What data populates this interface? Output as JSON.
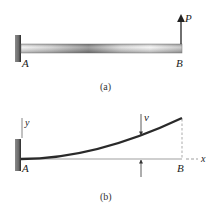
{
  "figure_a": {
    "caption": "(a)",
    "labels": {
      "fixed_end": "A",
      "free_end": "B",
      "load": "P"
    },
    "elements": [
      "fixed-wall-support",
      "cantilever-beam",
      "upward-point-load"
    ]
  },
  "figure_b": {
    "caption": "(b)",
    "labels": {
      "fixed_end": "A",
      "free_end": "B",
      "deflection": "v",
      "x_axis": "x",
      "y_axis": "y"
    },
    "elements": [
      "fixed-wall-support",
      "deflected-elastic-curve",
      "x-axis",
      "y-axis",
      "deflection-dimension-arrows",
      "dashed-projection-line"
    ]
  },
  "colors": {
    "beam_dark": "#4a4a4a",
    "beam_light": "#e8e8e8",
    "wall": "#555555",
    "curve": "#2a2a2a",
    "axis": "#555555"
  }
}
